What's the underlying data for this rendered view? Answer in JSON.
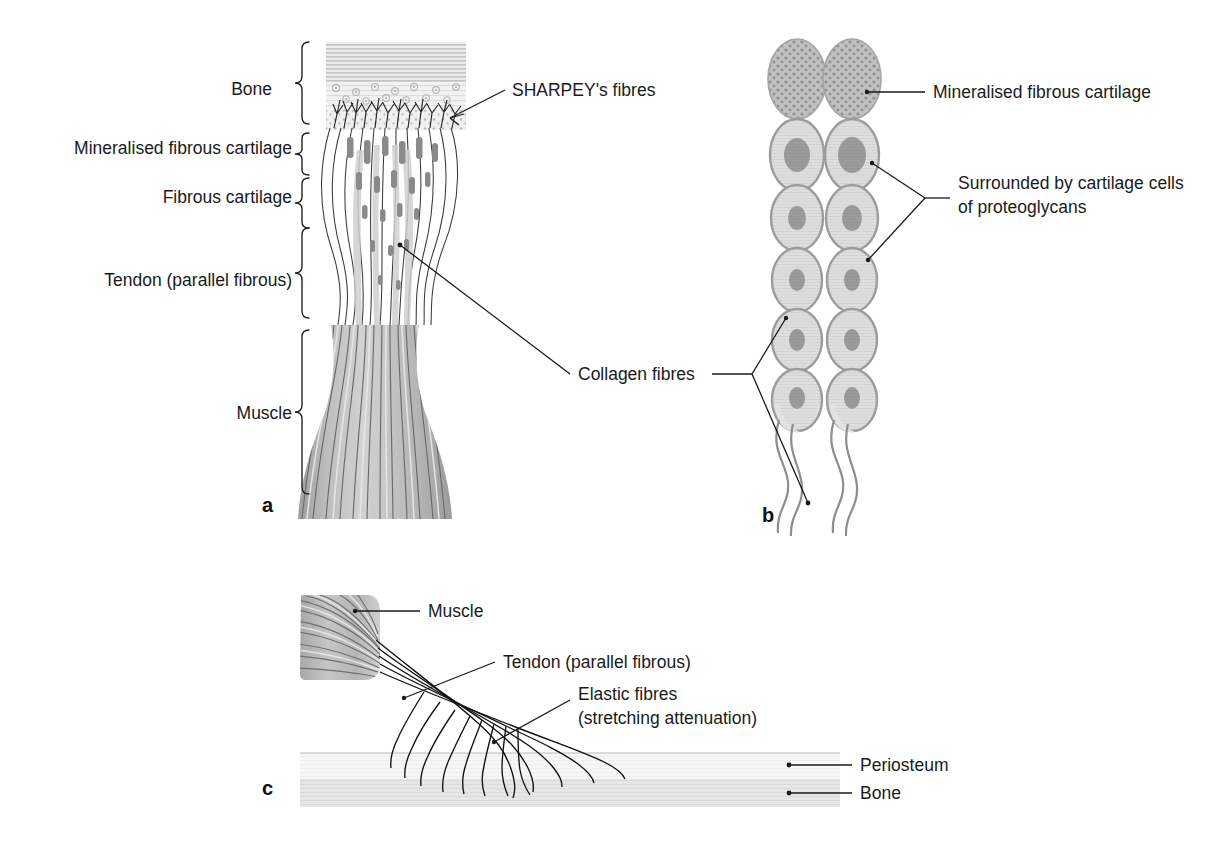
{
  "figure": {
    "panels": [
      {
        "id": "a",
        "id_label": "a"
      },
      {
        "id": "b",
        "id_label": "b"
      },
      {
        "id": "c",
        "id_label": "c"
      }
    ]
  },
  "panel_a": {
    "brace_labels": [
      {
        "text": "Bone"
      },
      {
        "text": "Mineralised fibrous cartilage"
      },
      {
        "text": "Fibrous cartilage"
      },
      {
        "text": "Tendon (parallel fibrous)"
      },
      {
        "text": "Muscle"
      }
    ],
    "callouts": [
      {
        "text": "SHARPEY's fibres"
      },
      {
        "text": "Collagen fibres"
      }
    ]
  },
  "panel_b": {
    "callouts": [
      {
        "text": "Mineralised fibrous cartilage"
      },
      {
        "text_line1": "Surrounded by cartilage cells",
        "text_line2": "of proteoglycans"
      }
    ]
  },
  "panel_c": {
    "callouts": [
      {
        "text": "Muscle"
      },
      {
        "text": "Tendon (parallel fibrous)"
      },
      {
        "text_line1": "Elastic fibres",
        "text_line2": "(stretching attenuation)"
      },
      {
        "text": "Periosteum"
      },
      {
        "text": "Bone"
      }
    ]
  },
  "colors": {
    "ink": "#1a1a1a",
    "fibre": "#3a3a3a",
    "bone_hatch": "#c9c9c9",
    "bone_mid": "#dcdcdc",
    "bone_stipple": "#e4e4e4",
    "muscle_fill": "#b4b4b4",
    "muscle_stripe": "#6e6e6e",
    "cell_fill": "#d9d9d9",
    "cell_outline": "#9a9a9a",
    "nucleus": "#8f8f8f",
    "mineralised_fill": "#bdbdbd",
    "mineralised_stipple": "#8a8a8a",
    "periosteum": "#f0f0f0",
    "bone_band": "#e0e0e0"
  }
}
